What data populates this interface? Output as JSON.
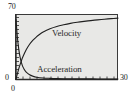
{
  "chart_data": {
    "type": "line",
    "title": "",
    "xlabel": "",
    "ylabel": "",
    "xlim": [
      0,
      30
    ],
    "ylim": [
      0,
      70
    ],
    "grid": false,
    "legend_position": "inline-annotations",
    "background_color": "#e8e8e6",
    "axis_color": "#2b2b2b",
    "curve_color": "#1f1f1f",
    "x_ticks": [
      0,
      30
    ],
    "x_tick_labels": [
      "0",
      "30"
    ],
    "y_ticks": [
      0,
      70
    ],
    "y_tick_labels": [
      "0",
      "70"
    ],
    "annotations": [
      {
        "name": "velocity-label",
        "text": "Velocity",
        "x": 12.5,
        "y": 47
      },
      {
        "name": "acceleration-label",
        "text": "Acceleration",
        "x": 7.5,
        "y": 13
      }
    ],
    "series": [
      {
        "name": "Velocity",
        "label": "Velocity",
        "x": [
          0,
          0.5,
          1,
          1.5,
          2,
          3,
          4,
          5,
          6,
          7,
          8,
          10,
          12,
          14,
          16,
          18,
          20,
          22,
          24,
          26,
          28,
          30
        ],
        "values": [
          0,
          7,
          13.5,
          19,
          24,
          32,
          38,
          42.5,
          46,
          49,
          51.5,
          55,
          57.5,
          59.3,
          60.8,
          62,
          63,
          63.9,
          64.7,
          65.4,
          66,
          66.6
        ]
      },
      {
        "name": "Acceleration",
        "label": "Acceleration",
        "x": [
          0,
          0.4,
          0.8,
          1.2,
          1.6,
          2,
          2.5,
          3,
          4,
          5,
          6,
          8,
          10,
          12,
          15,
          18,
          21,
          24,
          27,
          30
        ],
        "values": [
          65,
          46,
          33,
          24,
          18,
          13.5,
          10,
          7.6,
          4.6,
          3,
          2,
          1.1,
          0.7,
          0.45,
          0.25,
          0.15,
          0.1,
          0.07,
          0.05,
          0.04
        ]
      }
    ]
  },
  "axes": {
    "y_max_label": "70",
    "y_min_label": "0",
    "x_min_label": "0",
    "x_max_label": "30"
  },
  "labels": {
    "velocity": "Velocity",
    "acceleration": "Acceleration"
  }
}
